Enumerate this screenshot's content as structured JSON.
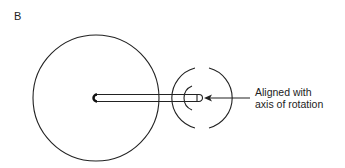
{
  "panel_label": "B",
  "annotation": {
    "line1": "Aligned with",
    "line2": "axis of rotation"
  },
  "elements": {
    "large_circle": "wheel",
    "rod": "shaft",
    "arcs": "rotation-indicator-arcs",
    "arrow": "pointer-arrow"
  }
}
